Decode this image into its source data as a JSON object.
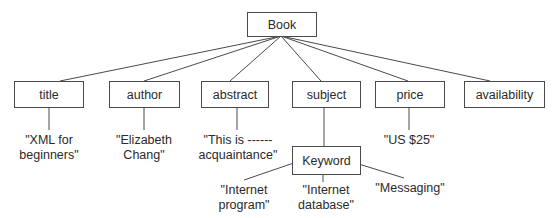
{
  "diagram": {
    "type": "tree",
    "root": {
      "id": "book",
      "label": "Book"
    },
    "elements": [
      {
        "id": "title",
        "label": "title",
        "value": "\"XML for\nbeginners\""
      },
      {
        "id": "author",
        "label": "author",
        "value": "\"Elizabeth\nChang\""
      },
      {
        "id": "abstract",
        "label": "abstract",
        "value": "\"This is ------\nacquaintance\""
      },
      {
        "id": "subject",
        "label": "subject"
      },
      {
        "id": "price",
        "label": "price",
        "value": "\"US $25\""
      },
      {
        "id": "availability",
        "label": "availability"
      }
    ],
    "keyword": {
      "id": "keyword",
      "label": "Keyword",
      "values": [
        "\"Internet\nprogram\"",
        "\"Internet\ndatabase\"",
        "\"Messaging\""
      ]
    },
    "edges": [
      [
        "Book",
        "title"
      ],
      [
        "Book",
        "author"
      ],
      [
        "Book",
        "abstract"
      ],
      [
        "Book",
        "subject"
      ],
      [
        "Book",
        "price"
      ],
      [
        "Book",
        "availability"
      ],
      [
        "title",
        "\"XML for beginners\""
      ],
      [
        "author",
        "\"Elizabeth Chang\""
      ],
      [
        "abstract",
        "\"This is ------ acquaintance\""
      ],
      [
        "subject",
        "Keyword"
      ],
      [
        "price",
        "\"US $25\""
      ],
      [
        "Keyword",
        "\"Internet program\""
      ],
      [
        "Keyword",
        "\"Internet database\""
      ],
      [
        "Keyword",
        "\"Messaging\""
      ]
    ],
    "colors": {
      "stroke": "#4a4a4a",
      "text": "#2a2a2a",
      "background": "#ffffff"
    }
  }
}
